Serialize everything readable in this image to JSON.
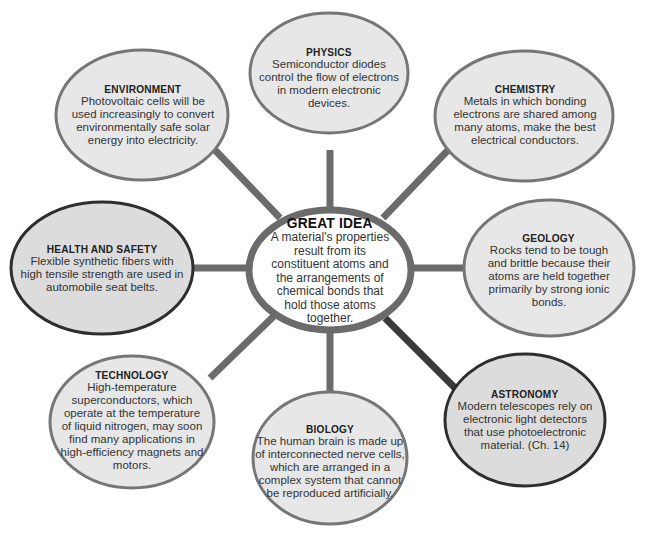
{
  "colors": {
    "node_fill": "#e7e7e7",
    "node_fill_highlight": "#dcdcdc",
    "node_stroke": "#6e6e6e",
    "node_stroke_highlight": "#2e2e2e",
    "center_fill": "#ffffff",
    "spoke": "#6b6b6b"
  },
  "center": {
    "title": "GREAT IDEA",
    "body": "A material's properties result from its constituent atoms and the arrangements of chemical bonds that hold those atoms together."
  },
  "nodes": {
    "physics": {
      "title": "PHYSICS",
      "body": "Semiconductor diodes control the flow of electrons in modern electronic devices."
    },
    "environment": {
      "title": "ENVIRONMENT",
      "body": "Photovoltaic cells will be used increasingly to convert environmentally safe solar energy into electricity."
    },
    "chemistry": {
      "title": "CHEMISTRY",
      "body": "Metals in which bonding electrons are shared among many atoms, make the best electrical conductors."
    },
    "health_safety": {
      "title": "HEALTH AND SAFETY",
      "body": "Flexible synthetic fibers with high tensile strength are used in automobile seat belts."
    },
    "geology": {
      "title": "GEOLOGY",
      "body": "Rocks tend to be tough and brittle because their atoms are held together primarily by strong ionic bonds."
    },
    "technology": {
      "title": "TECHNOLOGY",
      "body": "High-temperature superconductors, which operate at the temperature of liquid nitrogen, may soon find many applications in high-efficiency magnets and motors."
    },
    "biology": {
      "title": "BIOLOGY",
      "body": "The human brain is made up of interconnected nerve cells, which are arranged in a complex system that cannot be reproduced artificially."
    },
    "astronomy": {
      "title": "ASTRONOMY",
      "body": "Modern telescopes rely on electronic light detectors that use photoelectronic material. (Ch. 14)"
    }
  }
}
